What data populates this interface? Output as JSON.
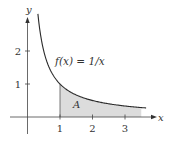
{
  "chart_data": {
    "type": "area",
    "title": "",
    "function_label": "f(x) = 1/x",
    "region_label": "A",
    "xlabel": "x",
    "ylabel": "y",
    "x_ticks": [
      1,
      2,
      3
    ],
    "y_ticks": [
      1,
      2
    ],
    "x_tick_labels": [
      "1",
      "2",
      "3"
    ],
    "y_tick_labels": [
      "1",
      "2"
    ],
    "xlim": [
      0,
      3.8
    ],
    "ylim": [
      0,
      3.1
    ],
    "curve": {
      "expr": "1/x",
      "x_start": 0.32,
      "x_end": 3.65
    },
    "shaded_region": {
      "x_from": 1,
      "x_to": 3.5,
      "under": "1/x"
    },
    "grid": false,
    "colors": {
      "curve": "#2a2a2a",
      "shade": "#dcdcdc",
      "axis": "#444444"
    }
  }
}
